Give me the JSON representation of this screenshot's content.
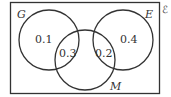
{
  "diagram": {
    "type": "venn",
    "universal_set_symbol": "ℰ",
    "sets": [
      {
        "name": "G",
        "label": "G"
      },
      {
        "name": "E",
        "label": "E"
      },
      {
        "name": "M",
        "label": "M"
      }
    ],
    "regions": {
      "G_only": "0.1",
      "G_and_M": "0.3",
      "E_and_M": "0.2",
      "E_only": "0.4"
    },
    "colors": {
      "stroke": "#333333",
      "background": "#ffffff"
    }
  }
}
